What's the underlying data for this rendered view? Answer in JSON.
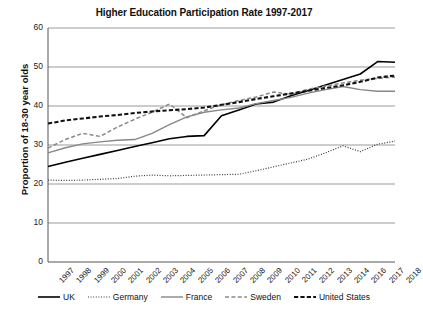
{
  "chart_data": {
    "type": "line",
    "title": "Higher Education Participation Rate 1997-2017",
    "xlabel": "",
    "ylabel": "Proportion of 18-30 year olds",
    "ylim": [
      0,
      60
    ],
    "yticks": [
      0,
      10,
      20,
      30,
      40,
      50,
      60
    ],
    "grid": "horizontal",
    "legend_position": "bottom",
    "categories": [
      "1997",
      "1998",
      "1999",
      "2000",
      "2001",
      "2002",
      "2003",
      "2004",
      "2005",
      "2006",
      "2007",
      "2008",
      "2009",
      "2010",
      "2011",
      "2012",
      "2013",
      "2014",
      "2016",
      "2017",
      "2018"
    ],
    "series": [
      {
        "name": "UK",
        "style": "solid",
        "color": "#000000",
        "width": 1.6,
        "values": [
          24.5,
          25.6,
          26.6,
          27.6,
          28.6,
          29.6,
          30.6,
          31.6,
          32.2,
          32.4,
          37.5,
          39.0,
          40.5,
          41.0,
          42.6,
          44.0,
          45.4,
          46.8,
          48.2,
          51.4,
          51.2
        ]
      },
      {
        "name": "Germany",
        "style": "dotted",
        "color": "#3a3a3a",
        "width": 1.2,
        "values": [
          21.0,
          20.9,
          21.0,
          21.2,
          21.4,
          22.0,
          22.3,
          22.1,
          22.2,
          22.3,
          22.4,
          22.5,
          23.4,
          24.4,
          25.4,
          26.4,
          28.0,
          29.8,
          28.3,
          30.2,
          31.0
        ]
      },
      {
        "name": "France",
        "style": "solid",
        "color": "#878787",
        "width": 1.4,
        "values": [
          28.0,
          29.3,
          30.3,
          30.8,
          31.2,
          31.4,
          33.0,
          35.2,
          37.2,
          38.4,
          39.0,
          39.5,
          40.6,
          41.4,
          42.2,
          43.3,
          44.2,
          45.0,
          44.2,
          43.8,
          43.8
        ]
      },
      {
        "name": "Sweden",
        "style": "dashed",
        "color": "#8a8a8a",
        "width": 1.5,
        "values": [
          29.2,
          31.4,
          33.0,
          32.2,
          34.6,
          36.6,
          38.4,
          40.5,
          37.0,
          38.8,
          40.3,
          41.4,
          42.3,
          43.6,
          43.0,
          44.3,
          45.1,
          45.9,
          46.6,
          47.1,
          47.4
        ]
      },
      {
        "name": "United States",
        "style": "dash-bold",
        "color": "#111111",
        "width": 2.1,
        "values": [
          35.5,
          36.3,
          36.8,
          37.3,
          37.7,
          38.2,
          38.6,
          38.9,
          39.2,
          39.6,
          40.3,
          41.0,
          41.8,
          42.5,
          43.2,
          43.9,
          44.6,
          45.3,
          46.2,
          47.3,
          47.8
        ]
      }
    ]
  },
  "legend": {
    "items": [
      {
        "label": "UK"
      },
      {
        "label": "Germany"
      },
      {
        "label": "France"
      },
      {
        "label": "Sweden"
      },
      {
        "label": "United States"
      }
    ]
  },
  "axes": {
    "plot_left": 48,
    "plot_right": 395,
    "plot_top": 28,
    "plot_bottom": 262
  }
}
